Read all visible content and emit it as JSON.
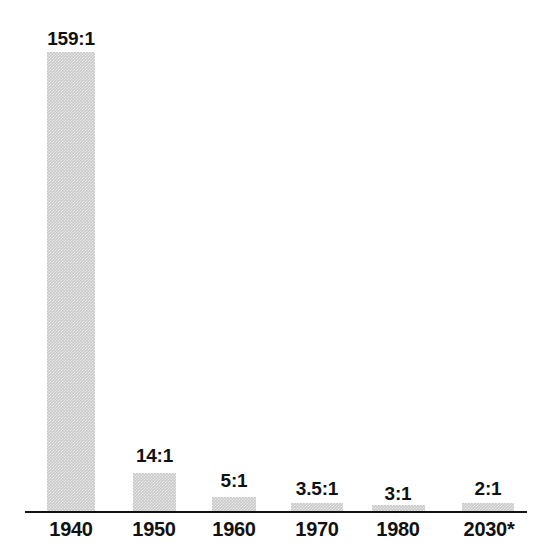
{
  "chart_data": {
    "type": "bar",
    "title": "",
    "subtitle": "",
    "xlabel": "",
    "ylabel": "",
    "categories": [
      "1940",
      "1950",
      "1960",
      "1970",
      "1980",
      "2030*"
    ],
    "values": [
      159,
      14,
      5,
      3.5,
      3,
      2
    ],
    "data_labels": [
      "159:1",
      "14:1",
      "5:1",
      "3.5:1",
      "3:1",
      "2:1"
    ],
    "ylim": [
      0,
      159
    ],
    "grid": false,
    "legend": null,
    "annotations": [
      "*"
    ],
    "bars": [
      {
        "category": "1940",
        "value": 159,
        "label": "159:1",
        "x": 47,
        "width": 48,
        "height": 459,
        "label_x": 37,
        "label_y": 29,
        "label_width": 68
      },
      {
        "category": "1950",
        "value": 14,
        "label": "14:1",
        "x": 133,
        "width": 43,
        "height": 38,
        "label_x": 124,
        "label_y": 446,
        "label_width": 61
      },
      {
        "category": "1960",
        "value": 5,
        "label": "5:1",
        "x": 212,
        "width": 44,
        "height": 14,
        "label_x": 204,
        "label_y": 471,
        "label_width": 60
      },
      {
        "category": "1970",
        "value": 3.5,
        "label": "3.5:1",
        "x": 291,
        "width": 52,
        "height": 8,
        "label_x": 281,
        "label_y": 479,
        "label_width": 72
      },
      {
        "category": "1980",
        "value": 3,
        "label": "3:1",
        "x": 372,
        "width": 53,
        "height": 6,
        "label_x": 368,
        "label_y": 484,
        "label_width": 60
      },
      {
        "category": "2030*",
        "value": 2,
        "label": "2:1",
        "x": 462,
        "width": 52,
        "height": 8,
        "label_x": 458,
        "label_y": 479,
        "label_width": 60
      }
    ],
    "category_label_positions": [
      {
        "label": "1940",
        "x": 36,
        "width": 70
      },
      {
        "label": "1950",
        "x": 119,
        "width": 70
      },
      {
        "label": "1960",
        "x": 199,
        "width": 70
      },
      {
        "label": "1970",
        "x": 282,
        "width": 70
      },
      {
        "label": "1980",
        "x": 363,
        "width": 70
      },
      {
        "label": "2030*",
        "x": 447,
        "width": 84
      }
    ],
    "colors": {
      "background": "#ffffff",
      "bar_fill": "#c9c9c9",
      "axis": "#111111",
      "text": "#111111"
    },
    "axis_line": {
      "x": 25,
      "y": 511,
      "width": 502,
      "thickness": 2
    }
  }
}
